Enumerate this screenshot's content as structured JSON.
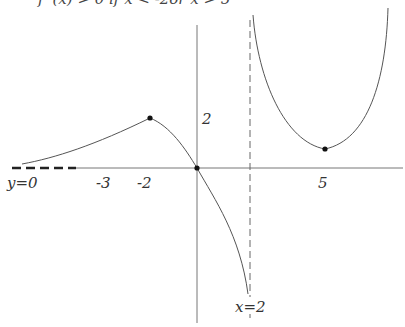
{
  "diagram": {
    "condition_text": "f '(x) > 0 if x < -2or x > 5",
    "labels": {
      "horizontal_asymptote": "y=0",
      "tick_neg3": "-3",
      "tick_neg2": "-2",
      "y_tick_2": "2",
      "tick_5": "5",
      "vertical_asymptote": "x=2"
    },
    "key_points": [
      {
        "name": "local-maximum",
        "x": -2,
        "y": 2
      },
      {
        "name": "origin",
        "x": 0,
        "y": 0
      },
      {
        "name": "local-minimum",
        "x": 5,
        "y": 1
      }
    ],
    "asymptotes": {
      "vertical": "x=2",
      "horizontal": "y=0"
    },
    "colors": {
      "curve": "#555555",
      "axis": "#777777",
      "point": "#111111",
      "dash": "#222222"
    }
  }
}
